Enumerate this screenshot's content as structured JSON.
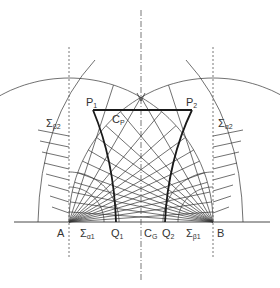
{
  "diagram": {
    "type": "slip-line field construction",
    "colors": {
      "line": "#333333",
      "thick": "#1a1a1a",
      "dashed": "#555555",
      "text": "#333333"
    },
    "points": {
      "A": {
        "label": "A",
        "x": 69,
        "y": 222
      },
      "B": {
        "label": "B",
        "x": 213,
        "y": 222
      },
      "P1": {
        "label": "P",
        "sub": "1",
        "x": 93,
        "y": 110
      },
      "P2": {
        "label": "P",
        "sub": "2",
        "x": 192,
        "y": 110
      },
      "Q1": {
        "label": "Q",
        "sub": "1",
        "x": 116,
        "y": 222
      },
      "Q2": {
        "label": "Q",
        "sub": "2",
        "x": 165,
        "y": 222
      },
      "CG": {
        "label": "C",
        "sub": "G",
        "x": 141,
        "y": 222
      },
      "CP": {
        "label": "C",
        "sub": "P",
        "x": 116,
        "y": 118
      },
      "V": {
        "label": "V",
        "x": 141,
        "y": 96
      }
    },
    "labels": {
      "sigma_alpha1": {
        "sym": "Σ",
        "sub": "α1"
      },
      "sigma_beta1": {
        "sym": "Σ",
        "sub": "β1"
      },
      "sigma_alpha2": {
        "sym": "Σ",
        "sub": "α2"
      },
      "sigma_beta2": {
        "sym": "Σ",
        "sub": "β2"
      }
    }
  }
}
